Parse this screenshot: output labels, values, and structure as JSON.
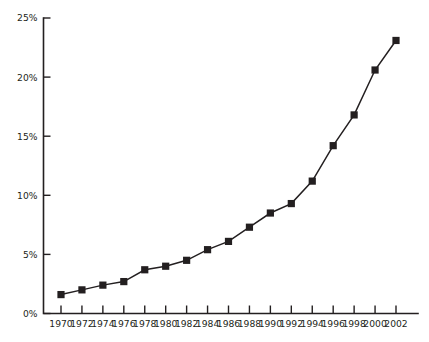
{
  "chart_data": {
    "type": "line",
    "title": "",
    "subtitle": "",
    "xlabel": "",
    "ylabel": "",
    "x": [
      1970,
      1972,
      1974,
      1976,
      1978,
      1980,
      1982,
      1984,
      1986,
      1988,
      1990,
      1992,
      1994,
      1996,
      1998,
      2000,
      2002
    ],
    "categories": [
      "1970",
      "1972",
      "1974",
      "1976",
      "1978",
      "1980",
      "1982",
      "1984",
      "1986",
      "1988",
      "1990",
      "1992",
      "1994",
      "1996",
      "1998",
      "2000",
      "2002"
    ],
    "values": [
      1.6,
      2.0,
      2.4,
      2.7,
      3.7,
      4.0,
      4.5,
      5.4,
      6.1,
      7.3,
      8.5,
      9.3,
      11.2,
      14.2,
      16.8,
      20.6,
      23.1
    ],
    "series": [
      {
        "name": "",
        "marker": "square",
        "color": "#231f20",
        "values": [
          1.6,
          2.0,
          2.4,
          2.7,
          3.7,
          4.0,
          4.5,
          5.4,
          6.1,
          7.3,
          8.5,
          9.3,
          11.2,
          14.2,
          16.8,
          20.6,
          23.1
        ]
      }
    ],
    "xlim": [
      1969,
      2003
    ],
    "ylim": [
      0,
      25
    ],
    "yticks": [
      0,
      5,
      10,
      15,
      20,
      25
    ],
    "ytick_labels": [
      "0%",
      "5%",
      "10%",
      "15%",
      "20%",
      "25%"
    ],
    "xticks": [
      1970,
      1972,
      1974,
      1976,
      1978,
      1980,
      1982,
      1984,
      1986,
      1988,
      1990,
      1992,
      1994,
      1996,
      1998,
      2000,
      2002
    ],
    "xtick_labels": [
      "1970",
      "1972",
      "1974",
      "1976",
      "1978",
      "1980",
      "1982",
      "1984",
      "1986",
      "1988",
      "1990",
      "1992",
      "1994",
      "1996",
      "1998",
      "2000",
      "2002"
    ],
    "grid": false,
    "legend": false,
    "legend_position": "none",
    "annotations": [],
    "axis_color": "#231f20",
    "background_color": "#ffffff"
  }
}
